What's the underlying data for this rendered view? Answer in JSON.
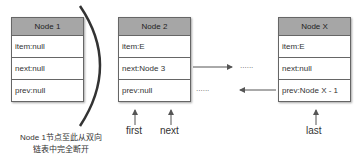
{
  "nodes": [
    {
      "title": "Node 1",
      "rows": [
        "item:null",
        "next:null",
        "prev:null"
      ]
    },
    {
      "title": "Node 2",
      "rows": [
        "item:E",
        "next:Node 3",
        "prev:null"
      ]
    },
    {
      "title": "Node X",
      "rows": [
        "item:E",
        "next:null",
        "prev:Node X - 1"
      ]
    }
  ],
  "ellipsis": "......",
  "pointers": {
    "first": "first",
    "next": "next",
    "last": "last"
  },
  "caption": {
    "line1": "Node 1节点至此从双向",
    "line2": "链表中完全断开"
  },
  "colors": {
    "header_bg": "#a6a6a6",
    "border": "#666666",
    "arrow": "#555555"
  }
}
